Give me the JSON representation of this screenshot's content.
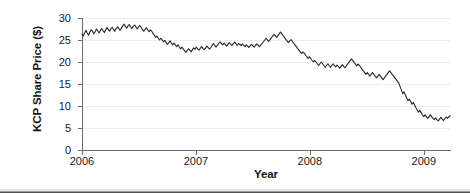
{
  "chart_data": {
    "type": "line",
    "title": "",
    "xlabel": "Year",
    "ylabel": "KCP Share Price ($)",
    "xlim": [
      2006.0,
      2009.23
    ],
    "ylim": [
      0,
      30
    ],
    "yticks": [
      0,
      5,
      10,
      15,
      20,
      25,
      30
    ],
    "ytick_labels": [
      "0",
      "5",
      "10",
      "15",
      "20",
      "25",
      "30"
    ],
    "xticks": [
      2006,
      2007,
      2008,
      2009
    ],
    "xtick_labels": [
      "2006",
      "2007",
      "2008",
      "2009"
    ],
    "grid": "horizontal",
    "legend": "none",
    "line_color": "#2e2e2e",
    "series": [
      {
        "name": "KCP Share Price",
        "x": [
          2006.0,
          2006.012,
          2006.023,
          2006.035,
          2006.046,
          2006.058,
          2006.069,
          2006.081,
          2006.092,
          2006.104,
          2006.115,
          2006.127,
          2006.138,
          2006.15,
          2006.162,
          2006.173,
          2006.185,
          2006.196,
          2006.208,
          2006.219,
          2006.231,
          2006.242,
          2006.254,
          2006.265,
          2006.277,
          2006.288,
          2006.3,
          2006.312,
          2006.323,
          2006.335,
          2006.346,
          2006.358,
          2006.369,
          2006.381,
          2006.392,
          2006.404,
          2006.415,
          2006.427,
          2006.438,
          2006.45,
          2006.462,
          2006.473,
          2006.485,
          2006.496,
          2006.508,
          2006.519,
          2006.531,
          2006.542,
          2006.554,
          2006.565,
          2006.577,
          2006.588,
          2006.6,
          2006.612,
          2006.623,
          2006.635,
          2006.646,
          2006.658,
          2006.669,
          2006.681,
          2006.692,
          2006.704,
          2006.715,
          2006.727,
          2006.738,
          2006.75,
          2006.762,
          2006.773,
          2006.785,
          2006.796,
          2006.808,
          2006.819,
          2006.831,
          2006.842,
          2006.854,
          2006.865,
          2006.877,
          2006.888,
          2006.9,
          2006.912,
          2006.923,
          2006.935,
          2006.946,
          2006.958,
          2006.969,
          2006.981,
          2006.992,
          2007.004,
          2007.015,
          2007.027,
          2007.038,
          2007.05,
          2007.062,
          2007.073,
          2007.085,
          2007.096,
          2007.108,
          2007.119,
          2007.131,
          2007.142,
          2007.154,
          2007.165,
          2007.177,
          2007.188,
          2007.2,
          2007.212,
          2007.223,
          2007.235,
          2007.246,
          2007.258,
          2007.269,
          2007.281,
          2007.292,
          2007.304,
          2007.315,
          2007.327,
          2007.338,
          2007.35,
          2007.362,
          2007.373,
          2007.385,
          2007.396,
          2007.408,
          2007.419,
          2007.431,
          2007.442,
          2007.454,
          2007.465,
          2007.477,
          2007.488,
          2007.5,
          2007.512,
          2007.523,
          2007.535,
          2007.546,
          2007.558,
          2007.569,
          2007.581,
          2007.592,
          2007.604,
          2007.615,
          2007.627,
          2007.638,
          2007.65,
          2007.662,
          2007.673,
          2007.685,
          2007.696,
          2007.708,
          2007.719,
          2007.731,
          2007.742,
          2007.754,
          2007.765,
          2007.777,
          2007.788,
          2007.8,
          2007.812,
          2007.823,
          2007.835,
          2007.846,
          2007.858,
          2007.869,
          2007.881,
          2007.892,
          2007.904,
          2007.915,
          2007.927,
          2007.938,
          2007.95,
          2007.962,
          2007.973,
          2007.985,
          2007.996,
          2008.008,
          2008.019,
          2008.031,
          2008.042,
          2008.054,
          2008.065,
          2008.077,
          2008.088,
          2008.1,
          2008.112,
          2008.123,
          2008.135,
          2008.146,
          2008.158,
          2008.169,
          2008.181,
          2008.192,
          2008.204,
          2008.215,
          2008.227,
          2008.238,
          2008.25,
          2008.262,
          2008.273,
          2008.285,
          2008.296,
          2008.308,
          2008.319,
          2008.331,
          2008.342,
          2008.354,
          2008.365,
          2008.377,
          2008.388,
          2008.4,
          2008.412,
          2008.423,
          2008.435,
          2008.446,
          2008.458,
          2008.469,
          2008.481,
          2008.492,
          2008.504,
          2008.515,
          2008.527,
          2008.538,
          2008.55,
          2008.562,
          2008.573,
          2008.585,
          2008.596,
          2008.608,
          2008.619,
          2008.631,
          2008.642,
          2008.654,
          2008.665,
          2008.677,
          2008.688,
          2008.7,
          2008.712,
          2008.723,
          2008.735,
          2008.746,
          2008.758,
          2008.769,
          2008.781,
          2008.792,
          2008.804,
          2008.815,
          2008.827,
          2008.838,
          2008.85,
          2008.862,
          2008.873,
          2008.885,
          2008.896,
          2008.908,
          2008.919,
          2008.931,
          2008.942,
          2008.954,
          2008.965,
          2008.977,
          2008.988,
          2009.0,
          2009.012,
          2009.023,
          2009.035,
          2009.046,
          2009.058,
          2009.069,
          2009.081,
          2009.092,
          2009.104,
          2009.115,
          2009.127,
          2009.138,
          2009.15,
          2009.162,
          2009.173,
          2009.185,
          2009.196,
          2009.208,
          2009.219,
          2009.231
        ],
        "y": [
          26.3,
          25.9,
          26.6,
          27.2,
          26.6,
          26.1,
          26.8,
          27.3,
          27.0,
          26.4,
          26.9,
          27.5,
          27.1,
          26.6,
          27.2,
          27.6,
          27.1,
          26.7,
          27.3,
          27.8,
          27.4,
          27.0,
          27.5,
          27.9,
          27.4,
          27.0,
          27.6,
          28.0,
          27.6,
          27.2,
          27.7,
          28.2,
          28.6,
          28.1,
          27.7,
          28.2,
          28.5,
          28.0,
          27.6,
          28.1,
          28.4,
          28.0,
          27.5,
          28.0,
          28.3,
          27.9,
          27.4,
          27.0,
          27.4,
          27.8,
          27.3,
          26.9,
          27.3,
          27.0,
          26.5,
          26.1,
          25.6,
          25.9,
          25.4,
          25.0,
          25.4,
          25.0,
          24.6,
          24.9,
          24.4,
          24.0,
          24.4,
          24.8,
          24.3,
          23.9,
          24.3,
          23.9,
          23.5,
          23.9,
          23.4,
          23.0,
          23.4,
          23.0,
          22.6,
          22.2,
          22.6,
          23.0,
          22.7,
          22.3,
          22.8,
          23.2,
          22.9,
          23.4,
          23.0,
          22.7,
          23.1,
          23.5,
          23.1,
          22.8,
          23.2,
          23.6,
          23.3,
          22.9,
          23.3,
          23.8,
          24.2,
          23.8,
          23.4,
          23.8,
          24.2,
          24.6,
          24.2,
          23.9,
          24.3,
          24.0,
          23.6,
          24.0,
          24.4,
          24.1,
          23.7,
          24.1,
          24.5,
          24.2,
          23.8,
          24.2,
          24.0,
          23.7,
          24.1,
          23.8,
          23.5,
          23.9,
          23.6,
          23.3,
          23.7,
          24.0,
          23.7,
          23.4,
          23.8,
          24.1,
          23.8,
          23.5,
          23.9,
          24.2,
          24.6,
          25.0,
          25.4,
          25.0,
          24.7,
          25.1,
          25.5,
          25.9,
          26.3,
          26.0,
          25.6,
          26.0,
          26.4,
          26.8,
          26.4,
          26.0,
          25.6,
          25.2,
          24.8,
          24.4,
          24.8,
          25.1,
          24.7,
          24.3,
          23.9,
          23.5,
          23.1,
          22.7,
          22.3,
          21.9,
          22.3,
          22.0,
          21.6,
          21.2,
          20.8,
          21.2,
          20.8,
          20.4,
          20.0,
          20.4,
          20.0,
          19.6,
          19.2,
          19.6,
          20.0,
          19.6,
          19.2,
          18.8,
          19.2,
          19.6,
          19.2,
          18.8,
          19.2,
          19.6,
          19.2,
          18.9,
          19.3,
          19.0,
          18.6,
          19.0,
          19.4,
          19.0,
          18.7,
          19.1,
          19.5,
          19.9,
          20.3,
          20.7,
          20.3,
          19.9,
          19.5,
          19.1,
          19.5,
          19.2,
          18.8,
          18.4,
          18.0,
          17.6,
          17.2,
          17.6,
          17.2,
          16.8,
          17.2,
          17.6,
          17.2,
          16.8,
          16.4,
          16.8,
          17.2,
          16.8,
          16.4,
          16.0,
          16.4,
          16.8,
          17.2,
          17.6,
          18.0,
          17.6,
          17.2,
          16.8,
          16.4,
          16.0,
          15.6,
          15.2,
          14.4,
          13.6,
          12.8,
          13.2,
          12.5,
          11.8,
          11.2,
          11.6,
          11.0,
          10.4,
          10.8,
          10.2,
          9.6,
          9.1,
          8.6,
          9.0,
          8.5,
          8.0,
          7.6,
          8.0,
          7.6,
          7.2,
          7.6,
          8.0,
          7.6,
          7.2,
          6.9,
          7.3,
          6.9,
          6.6,
          7.0,
          7.4,
          7.0,
          6.7,
          7.1,
          7.5,
          7.2,
          7.5,
          7.8
        ]
      }
    ]
  }
}
